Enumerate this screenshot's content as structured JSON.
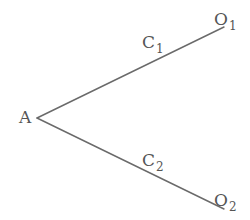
{
  "diagram": {
    "type": "tree",
    "nodes": {
      "root": {
        "label": "A",
        "x": 24,
        "y": 122
      },
      "o1": {
        "label": "O",
        "subscript": "1",
        "x": 216,
        "y": 25
      },
      "o2": {
        "label": "O",
        "subscript": "2",
        "x": 216,
        "y": 208
      }
    },
    "edges": [
      {
        "from": "A",
        "to": "O1",
        "label": "C",
        "subscript": "1",
        "x1": 37,
        "y1": 118,
        "x2": 224,
        "y2": 27
      },
      {
        "from": "A",
        "to": "O2",
        "label": "C",
        "subscript": "2",
        "x1": 37,
        "y1": 118,
        "x2": 224,
        "y2": 209
      }
    ],
    "edge_labels": {
      "c1": {
        "label": "C",
        "subscript": "1",
        "x": 143,
        "y": 49
      },
      "c2": {
        "label": "C",
        "subscript": "2",
        "x": 143,
        "y": 167
      }
    },
    "colors": {
      "line": "#6a6a6a",
      "text": "#555555",
      "background": "#ffffff"
    }
  }
}
